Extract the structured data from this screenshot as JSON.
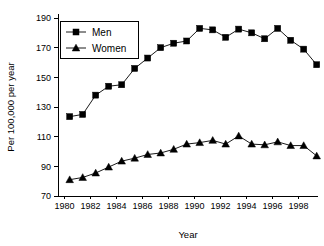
{
  "chart_data": {
    "type": "line",
    "title": "",
    "xlabel": "Year",
    "ylabel": "Per 100,000 per year",
    "xlim": [
      1979.5,
      1999.5
    ],
    "ylim": [
      70,
      190
    ],
    "grid": false,
    "legend_position": "top-left",
    "x_ticks": [
      1980,
      1982,
      1984,
      1986,
      1988,
      1990,
      1992,
      1994,
      1996,
      1998
    ],
    "x_tick_labels": [
      "1980",
      "1982",
      "1984",
      "1986",
      "1988",
      "1990",
      "1992",
      "1994",
      "1996",
      "1998"
    ],
    "y_ticks": [
      70,
      90,
      110,
      130,
      150,
      170,
      190
    ],
    "y_tick_labels": [
      "70",
      "90",
      "110",
      "130",
      "150",
      "170",
      "190"
    ],
    "x": [
      1980.4,
      1981.4,
      1982.4,
      1983.4,
      1984.4,
      1985.4,
      1986.4,
      1987.4,
      1988.4,
      1989.4,
      1990.4,
      1991.4,
      1992.4,
      1993.4,
      1994.4,
      1995.4,
      1996.4,
      1997.4,
      1998.4,
      1999.4
    ],
    "series": [
      {
        "name": "Men",
        "marker": "square",
        "color": "#000000",
        "values": [
          123.5,
          125.0,
          138.0,
          144.0,
          145.0,
          156.0,
          163.0,
          170.0,
          173.0,
          174.5,
          183.0,
          182.0,
          177.0,
          182.5,
          180.0,
          176.0,
          183.0,
          175.0,
          169.0,
          158.5
        ]
      },
      {
        "name": "Women",
        "marker": "triangle",
        "color": "#000000",
        "values": [
          81.0,
          82.5,
          85.5,
          89.5,
          93.5,
          95.5,
          98.0,
          99.0,
          101.5,
          105.0,
          106.0,
          107.5,
          105.0,
          110.5,
          105.0,
          104.5,
          106.5,
          104.0,
          104.0,
          97.0
        ]
      }
    ]
  },
  "legend": {
    "entries": [
      {
        "label": "Men"
      },
      {
        "label": "Women"
      }
    ]
  }
}
